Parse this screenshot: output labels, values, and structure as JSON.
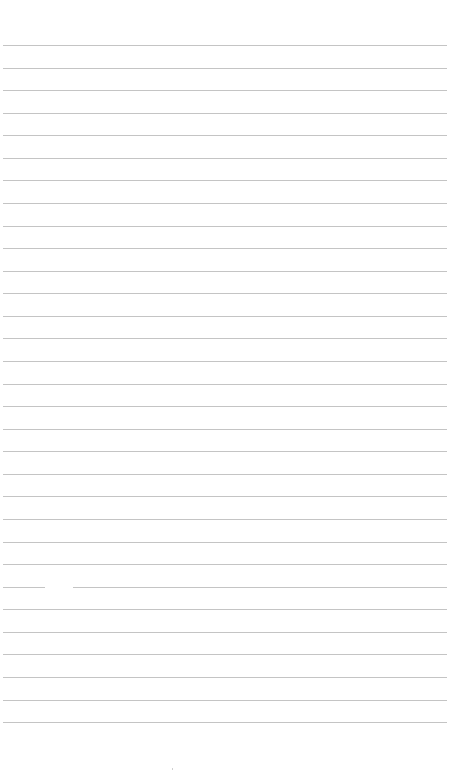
{
  "document": {
    "type": "lined-paper",
    "line_color": "#c4c4c4",
    "background_color": "#ffffff",
    "line_count": 31,
    "first_line_y": 45,
    "line_spacing": 22.57,
    "text": ""
  }
}
